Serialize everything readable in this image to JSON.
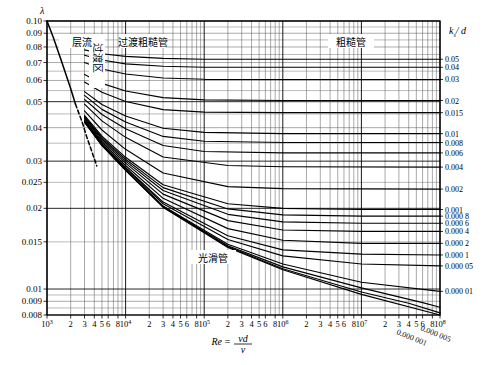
{
  "chart_data": {
    "type": "line",
    "title": "",
    "xlabel": "Re = vd/ν",
    "ylabel": "λ",
    "xlabel_parts": {
      "re": "Re",
      "eq": "=",
      "num": "vd",
      "den": "ν"
    },
    "right_axis_label": "kₛ/ d",
    "right_axis_label_parts": {
      "k": "k",
      "sub": "s",
      "slash": "/ ",
      "d": "d"
    },
    "xscale": "log",
    "yscale": "log",
    "xlim": [
      1000,
      100000000
    ],
    "ylim": [
      0.008,
      0.1
    ],
    "grid": true,
    "legend": "none",
    "xticks": [
      {
        "v": 1000,
        "label": "10",
        "sup": "3"
      },
      {
        "v": 2000,
        "label": "2",
        "sup": ""
      },
      {
        "v": 3000,
        "label": "3",
        "sup": ""
      },
      {
        "v": 4000,
        "label": "4",
        "sup": ""
      },
      {
        "v": 5000,
        "label": "5",
        "sup": ""
      },
      {
        "v": 6000,
        "label": "6",
        "sup": ""
      },
      {
        "v": 8000,
        "label": "8",
        "sup": ""
      },
      {
        "v": 10000,
        "label": "10",
        "sup": "4"
      },
      {
        "v": 20000,
        "label": "2",
        "sup": ""
      },
      {
        "v": 30000,
        "label": "3",
        "sup": ""
      },
      {
        "v": 40000,
        "label": "4",
        "sup": ""
      },
      {
        "v": 50000,
        "label": "5",
        "sup": ""
      },
      {
        "v": 60000,
        "label": "6",
        "sup": ""
      },
      {
        "v": 80000,
        "label": "8",
        "sup": ""
      },
      {
        "v": 100000,
        "label": "10",
        "sup": "5"
      },
      {
        "v": 200000,
        "label": "2",
        "sup": ""
      },
      {
        "v": 300000,
        "label": "3",
        "sup": ""
      },
      {
        "v": 400000,
        "label": "4",
        "sup": ""
      },
      {
        "v": 500000,
        "label": "5",
        "sup": ""
      },
      {
        "v": 600000,
        "label": "6",
        "sup": ""
      },
      {
        "v": 800000,
        "label": "8",
        "sup": ""
      },
      {
        "v": 1000000,
        "label": "10",
        "sup": "6"
      },
      {
        "v": 2000000,
        "label": "2",
        "sup": ""
      },
      {
        "v": 3000000,
        "label": "3",
        "sup": ""
      },
      {
        "v": 4000000,
        "label": "4",
        "sup": ""
      },
      {
        "v": 5000000,
        "label": "5",
        "sup": ""
      },
      {
        "v": 6000000,
        "label": "6",
        "sup": ""
      },
      {
        "v": 8000000,
        "label": "8",
        "sup": ""
      },
      {
        "v": 10000000,
        "label": "10",
        "sup": "7"
      },
      {
        "v": 20000000,
        "label": "2",
        "sup": ""
      },
      {
        "v": 30000000,
        "label": "3",
        "sup": ""
      },
      {
        "v": 40000000,
        "label": "4",
        "sup": ""
      },
      {
        "v": 50000000,
        "label": "5",
        "sup": ""
      },
      {
        "v": 60000000,
        "label": "6",
        "sup": ""
      },
      {
        "v": 80000000,
        "label": "8",
        "sup": ""
      },
      {
        "v": 100000000,
        "label": "10",
        "sup": "8"
      }
    ],
    "yticks": [
      {
        "v": 0.1,
        "label": "0.10"
      },
      {
        "v": 0.09,
        "label": "0.09"
      },
      {
        "v": 0.08,
        "label": "0.08"
      },
      {
        "v": 0.07,
        "label": "0.07"
      },
      {
        "v": 0.06,
        "label": "0.06"
      },
      {
        "v": 0.05,
        "label": "0.05"
      },
      {
        "v": 0.04,
        "label": "0.04"
      },
      {
        "v": 0.03,
        "label": "0.03"
      },
      {
        "v": 0.025,
        "label": "0.025"
      },
      {
        "v": 0.02,
        "label": "0.02"
      },
      {
        "v": 0.015,
        "label": "0.015"
      },
      {
        "v": 0.01,
        "label": "0.01"
      },
      {
        "v": 0.009,
        "label": "0.009"
      },
      {
        "v": 0.008,
        "label": "0.008"
      }
    ],
    "right_labels": [
      {
        "y": 0.072,
        "label": "0.05"
      },
      {
        "y": 0.0672,
        "label": "0.04"
      },
      {
        "y": 0.0605,
        "label": "0.03"
      },
      {
        "y": 0.0505,
        "label": "0.02"
      },
      {
        "y": 0.0455,
        "label": "0.015"
      },
      {
        "y": 0.038,
        "label": "0.01"
      },
      {
        "y": 0.0352,
        "label": "0.008"
      },
      {
        "y": 0.0322,
        "label": "0.006"
      },
      {
        "y": 0.0285,
        "label": "0.004"
      },
      {
        "y": 0.0236,
        "label": "0.002"
      },
      {
        "y": 0.0198,
        "label": "0.001"
      },
      {
        "y": 0.0187,
        "label": "0.000 8"
      },
      {
        "y": 0.0176,
        "label": "0.000 6"
      },
      {
        "y": 0.0164,
        "label": "0.000 4"
      },
      {
        "y": 0.0148,
        "label": "0.000 2"
      },
      {
        "y": 0.0134,
        "label": "0.000 1"
      },
      {
        "y": 0.0122,
        "label": "0.000 05"
      },
      {
        "y": 0.0098,
        "label": "0.000 01"
      }
    ],
    "diagonal_labels": [
      {
        "label": "0.000 001"
      },
      {
        "label": "0.000 005"
      }
    ],
    "zones": [
      {
        "name": "laminar",
        "label": "层流",
        "x": 82,
        "y": 42,
        "rotate": 0
      },
      {
        "name": "transition-zone",
        "label": "过渡区",
        "x": 97,
        "y": 58,
        "rotate": 90
      },
      {
        "name": "transition-rough",
        "label": "过渡粗糙管",
        "x": 143,
        "y": 42,
        "rotate": 0
      },
      {
        "name": "rough-pipe",
        "label": "粗糙管",
        "x": 351,
        "y": 42,
        "rotate": 0
      },
      {
        "name": "smooth-pipe",
        "label": "光滑管",
        "x": 213,
        "y": 258,
        "rotate": 0
      }
    ],
    "series": [
      {
        "name": "laminar-line",
        "style": "solid",
        "points": [
          [
            1000,
            0.1
          ],
          [
            1200,
            0.087
          ],
          [
            1500,
            0.072
          ],
          [
            2000,
            0.056
          ],
          [
            2300,
            0.049
          ]
        ]
      },
      {
        "name": "laminar-line-dashed",
        "style": "dashed",
        "points": [
          [
            2300,
            0.049
          ],
          [
            2800,
            0.042
          ],
          [
            3200,
            0.037
          ],
          [
            3800,
            0.032
          ],
          [
            4300,
            0.0288
          ]
        ]
      },
      {
        "name": "ks-0.05",
        "ks": 0.05,
        "points": [
          [
            3000,
            0.078
          ],
          [
            5000,
            0.0755
          ],
          [
            10000,
            0.0738
          ],
          [
            30000,
            0.0725
          ],
          [
            100000,
            0.072
          ],
          [
            1000000,
            0.072
          ],
          [
            100000000,
            0.072
          ]
        ]
      },
      {
        "name": "ks-0.04",
        "ks": 0.04,
        "points": [
          [
            3000,
            0.0745
          ],
          [
            5000,
            0.0715
          ],
          [
            10000,
            0.0692
          ],
          [
            30000,
            0.0678
          ],
          [
            100000,
            0.0672
          ],
          [
            1000000,
            0.0672
          ],
          [
            100000000,
            0.0672
          ]
        ]
      },
      {
        "name": "ks-0.03",
        "ks": 0.03,
        "points": [
          [
            3000,
            0.07
          ],
          [
            5000,
            0.0662
          ],
          [
            10000,
            0.0634
          ],
          [
            30000,
            0.0613
          ],
          [
            100000,
            0.0606
          ],
          [
            1000000,
            0.0605
          ],
          [
            100000000,
            0.0605
          ]
        ]
      },
      {
        "name": "ks-0.02",
        "ks": 0.02,
        "points": [
          [
            3000,
            0.0632
          ],
          [
            5000,
            0.0585
          ],
          [
            10000,
            0.0548
          ],
          [
            30000,
            0.0518
          ],
          [
            100000,
            0.0508
          ],
          [
            1000000,
            0.0505
          ],
          [
            100000000,
            0.0505
          ]
        ]
      },
      {
        "name": "ks-0.015",
        "ks": 0.015,
        "points": [
          [
            3000,
            0.0592
          ],
          [
            5000,
            0.0542
          ],
          [
            10000,
            0.0501
          ],
          [
            30000,
            0.0467
          ],
          [
            100000,
            0.0457
          ],
          [
            1000000,
            0.0455
          ],
          [
            100000000,
            0.0455
          ]
        ]
      },
      {
        "name": "ks-0.01",
        "ks": 0.01,
        "points": [
          [
            3000,
            0.0545
          ],
          [
            5000,
            0.0488
          ],
          [
            10000,
            0.0442
          ],
          [
            30000,
            0.0398
          ],
          [
            100000,
            0.0384
          ],
          [
            1000000,
            0.038
          ],
          [
            100000000,
            0.038
          ]
        ]
      },
      {
        "name": "ks-0.008",
        "ks": 0.008,
        "points": [
          [
            3000,
            0.0528
          ],
          [
            5000,
            0.0468
          ],
          [
            10000,
            0.042
          ],
          [
            30000,
            0.0371
          ],
          [
            100000,
            0.0356
          ],
          [
            1000000,
            0.0352
          ],
          [
            100000000,
            0.0352
          ]
        ]
      },
      {
        "name": "ks-0.006",
        "ks": 0.006,
        "points": [
          [
            3000,
            0.051
          ],
          [
            5000,
            0.0448
          ],
          [
            10000,
            0.0396
          ],
          [
            30000,
            0.0343
          ],
          [
            100000,
            0.0326
          ],
          [
            1000000,
            0.0322
          ],
          [
            100000000,
            0.0322
          ]
        ]
      },
      {
        "name": "ks-0.004",
        "ks": 0.004,
        "points": [
          [
            3000,
            0.049
          ],
          [
            5000,
            0.0424
          ],
          [
            10000,
            0.0368
          ],
          [
            30000,
            0.0311
          ],
          [
            200000,
            0.0289
          ],
          [
            1000000,
            0.0286
          ],
          [
            100000000,
            0.0285
          ]
        ]
      },
      {
        "name": "ks-0.002",
        "ks": 0.002,
        "points": [
          [
            3000,
            0.0462
          ],
          [
            5000,
            0.0392
          ],
          [
            10000,
            0.0332
          ],
          [
            30000,
            0.0271
          ],
          [
            200000,
            0.0241
          ],
          [
            1000000,
            0.0237
          ],
          [
            100000000,
            0.0236
          ]
        ]
      },
      {
        "name": "ks-0.001",
        "ks": 0.001,
        "points": [
          [
            3000,
            0.0445
          ],
          [
            5000,
            0.0372
          ],
          [
            10000,
            0.031
          ],
          [
            30000,
            0.0245
          ],
          [
            200000,
            0.0208
          ],
          [
            1000000,
            0.02
          ],
          [
            10000000,
            0.0198
          ],
          [
            100000000,
            0.0198
          ]
        ]
      },
      {
        "name": "ks-0.0008",
        "ks": 0.0008,
        "points": [
          [
            3000,
            0.0441
          ],
          [
            5000,
            0.0367
          ],
          [
            10000,
            0.0305
          ],
          [
            30000,
            0.0239
          ],
          [
            200000,
            0.0199
          ],
          [
            1000000,
            0.0189
          ],
          [
            10000000,
            0.0187
          ],
          [
            100000000,
            0.0187
          ]
        ]
      },
      {
        "name": "ks-0.0006",
        "ks": 0.0006,
        "points": [
          [
            3000,
            0.0437
          ],
          [
            5000,
            0.0363
          ],
          [
            10000,
            0.03
          ],
          [
            30000,
            0.0233
          ],
          [
            200000,
            0.019
          ],
          [
            1000000,
            0.0178
          ],
          [
            10000000,
            0.0176
          ],
          [
            100000000,
            0.0176
          ]
        ]
      },
      {
        "name": "ks-0.0004",
        "ks": 0.0004,
        "points": [
          [
            3000,
            0.0433
          ],
          [
            5000,
            0.0358
          ],
          [
            10000,
            0.0295
          ],
          [
            30000,
            0.0226
          ],
          [
            200000,
            0.018
          ],
          [
            1000000,
            0.0166
          ],
          [
            10000000,
            0.0164
          ],
          [
            100000000,
            0.0164
          ]
        ]
      },
      {
        "name": "ks-0.0002",
        "ks": 0.0002,
        "points": [
          [
            3000,
            0.0428
          ],
          [
            5000,
            0.0353
          ],
          [
            10000,
            0.0289
          ],
          [
            30000,
            0.0218
          ],
          [
            200000,
            0.0168
          ],
          [
            1000000,
            0.0152
          ],
          [
            10000000,
            0.0148
          ],
          [
            100000000,
            0.0148
          ]
        ]
      },
      {
        "name": "ks-0.0001",
        "ks": 0.0001,
        "points": [
          [
            3000,
            0.0425
          ],
          [
            5000,
            0.0349
          ],
          [
            10000,
            0.0284
          ],
          [
            30000,
            0.0211
          ],
          [
            200000,
            0.0158
          ],
          [
            1000000,
            0.014
          ],
          [
            10000000,
            0.0135
          ],
          [
            100000000,
            0.0134
          ]
        ]
      },
      {
        "name": "ks-0.00005",
        "ks": 5e-05,
        "points": [
          [
            3000,
            0.0423
          ],
          [
            5000,
            0.0347
          ],
          [
            10000,
            0.0282
          ],
          [
            30000,
            0.0208
          ],
          [
            200000,
            0.0153
          ],
          [
            1000000,
            0.0133
          ],
          [
            10000000,
            0.0124
          ],
          [
            100000000,
            0.0122
          ]
        ]
      },
      {
        "name": "ks-0.00001",
        "ks": 1e-05,
        "points": [
          [
            3000,
            0.0421
          ],
          [
            5000,
            0.0345
          ],
          [
            10000,
            0.0279
          ],
          [
            30000,
            0.0204
          ],
          [
            200000,
            0.0147
          ],
          [
            1000000,
            0.0124
          ],
          [
            10000000,
            0.0106
          ],
          [
            100000000,
            0.0098
          ]
        ]
      },
      {
        "name": "ks-0.000005",
        "ks": 5e-06,
        "points": [
          [
            3000,
            0.042
          ],
          [
            5000,
            0.0344
          ],
          [
            10000,
            0.0278
          ],
          [
            30000,
            0.0203
          ],
          [
            200000,
            0.0145
          ],
          [
            1000000,
            0.0121
          ],
          [
            10000000,
            0.0101
          ],
          [
            60000000,
            0.0089
          ],
          [
            100000000,
            0.00855
          ]
        ]
      },
      {
        "name": "ks-0.000001",
        "ks": 1e-06,
        "points": [
          [
            3000,
            0.042
          ],
          [
            5000,
            0.0344
          ],
          [
            10000,
            0.0278
          ],
          [
            30000,
            0.0202
          ],
          [
            200000,
            0.0144
          ],
          [
            1000000,
            0.0119
          ],
          [
            10000000,
            0.00975
          ],
          [
            40000000,
            0.00885
          ],
          [
            100000000,
            0.00815
          ]
        ]
      },
      {
        "name": "smooth-pipe-curve",
        "ks": 0,
        "points": [
          [
            3000,
            0.0419
          ],
          [
            5000,
            0.0343
          ],
          [
            10000,
            0.0277
          ],
          [
            30000,
            0.0202
          ],
          [
            200000,
            0.0143
          ],
          [
            1000000,
            0.0118
          ],
          [
            10000000,
            0.00955
          ],
          [
            100000000,
            0.008
          ]
        ]
      }
    ]
  },
  "plot": {
    "left": 47,
    "right": 440,
    "top": 21,
    "bottom": 315
  }
}
